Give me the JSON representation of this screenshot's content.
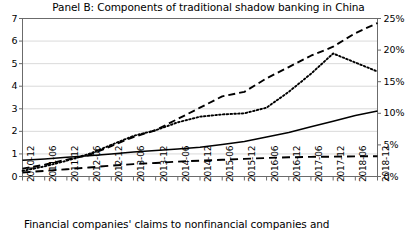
{
  "chart_data": {
    "type": "line",
    "title": "Panel B: Components of traditional shadow banking in China",
    "caption": "Financial companies' claims to nonfinancial companies and",
    "xlabel": "",
    "ylabel": "",
    "ylim": [
      0,
      7
    ],
    "y2lim": [
      0,
      25
    ],
    "grid": true,
    "legend_position": "none",
    "x": [
      "2010-12",
      "2011-06",
      "2011-12",
      "2012-06",
      "2012-12",
      "2013-06",
      "2013-12",
      "2014-06",
      "2014-12",
      "2015-06",
      "2015-12",
      "2016-06",
      "2016-12",
      "2017-06",
      "2017-12",
      "2018-06",
      "2018-12"
    ],
    "y_ticks": [
      0,
      1,
      2,
      3,
      4,
      5,
      6,
      7
    ],
    "y2_ticks": [
      "0%",
      "5%",
      "10%",
      "15%",
      "20%",
      "25%"
    ],
    "series": [
      {
        "name": "entrusted-loans",
        "style": "dashed",
        "axis": "left",
        "values": [
          0.35,
          0.52,
          0.75,
          0.95,
          1.35,
          1.75,
          2.05,
          2.55,
          3.05,
          3.55,
          3.75,
          4.35,
          4.85,
          5.35,
          5.75,
          6.35,
          6.8
        ]
      },
      {
        "name": "trust-loans",
        "style": "dotted",
        "axis": "left",
        "values": [
          0.25,
          0.45,
          0.7,
          1.0,
          1.4,
          1.8,
          2.05,
          2.4,
          2.65,
          2.75,
          2.8,
          3.05,
          3.75,
          4.55,
          5.45,
          5.05,
          4.65
        ]
      },
      {
        "name": "undiscounted-bankers-acceptances",
        "style": "solid",
        "axis": "left",
        "values": [
          0.72,
          0.78,
          0.85,
          0.92,
          1.0,
          1.08,
          1.15,
          1.22,
          1.3,
          1.42,
          1.55,
          1.75,
          1.95,
          2.2,
          2.45,
          2.7,
          2.9
        ]
      },
      {
        "name": "other-claims",
        "style": "longdash",
        "axis": "left",
        "values": [
          0.18,
          0.25,
          0.32,
          0.4,
          0.48,
          0.55,
          0.6,
          0.66,
          0.7,
          0.74,
          0.78,
          0.82,
          0.85,
          0.87,
          0.88,
          0.89,
          0.9
        ]
      }
    ]
  }
}
